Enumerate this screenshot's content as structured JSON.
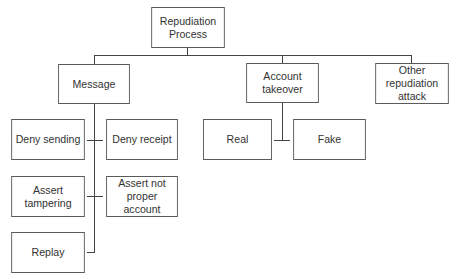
{
  "diagram": {
    "root": {
      "label": "Repudiation\nProcess"
    },
    "level1": [
      {
        "label": "Message"
      },
      {
        "label": "Account\ntakeover"
      },
      {
        "label": "Other\nrepudiation\nattack"
      }
    ],
    "message_children": [
      {
        "label": "Deny sending"
      },
      {
        "label": "Deny receipt"
      },
      {
        "label": "Assert\ntampering"
      },
      {
        "label": "Assert not\nproper account"
      },
      {
        "label": "Replay"
      }
    ],
    "account_children": [
      {
        "label": "Real"
      },
      {
        "label": "Fake"
      }
    ]
  }
}
